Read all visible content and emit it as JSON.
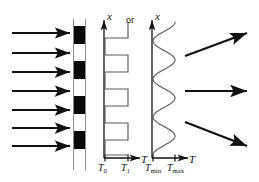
{
  "figure": {
    "background_color": "#ffffff",
    "ink_color": "#111111",
    "curve_color": "#5a5a5a"
  },
  "incident": {
    "label": "incident-rays",
    "count": 7,
    "direction": "right",
    "x_start": 12,
    "x_end": 70,
    "ys": [
      33,
      53,
      72,
      91,
      110,
      128,
      146
    ]
  },
  "grating": {
    "label": "absorbing-grating-mask",
    "x": 73,
    "width": 13,
    "y_top": 19,
    "y_bottom": 170,
    "bar_color": "#0a0a0a",
    "gap_color": "#ffffff",
    "frame_color": "#8a8a8a",
    "bands": [
      {
        "type": "dark",
        "y": 26,
        "height": 18
      },
      {
        "type": "light",
        "y": 44,
        "height": 17
      },
      {
        "type": "dark",
        "y": 61,
        "height": 18
      },
      {
        "type": "light",
        "y": 79,
        "height": 17
      },
      {
        "type": "dark",
        "y": 96,
        "height": 18
      },
      {
        "type": "light",
        "y": 114,
        "height": 17
      },
      {
        "type": "dark",
        "y": 131,
        "height": 18
      }
    ],
    "rails": [
      {
        "x": 73.5,
        "y_top": 19,
        "y_bottom": 170
      },
      {
        "x": 85.5,
        "y_top": 19,
        "y_bottom": 170
      }
    ]
  },
  "plot_square": {
    "label": "square-wave-temperature-profile",
    "y_axis_label": "x",
    "x_axis_label": "T",
    "axis_origin_x": 104,
    "axis_origin_y": 158,
    "axis_top_y": 20,
    "axis_right_x": 140,
    "tick_low_x": 105,
    "tick_high_x": 128,
    "tick_labels": [
      {
        "base": "T",
        "sub": "0",
        "x": 98,
        "y": 163
      },
      {
        "base": "T",
        "sub": "1",
        "x": 121,
        "y": 163
      }
    ],
    "waveform": {
      "type": "square",
      "low_value_x": 105,
      "high_value_x": 128,
      "cycles": 3.5,
      "edges_y": [
        22,
        38,
        55,
        72,
        89,
        106,
        123,
        140,
        155
      ],
      "starts_high": true
    }
  },
  "connector": {
    "label": "or-connector",
    "text": "or",
    "x": 126,
    "y": 15
  },
  "plot_sine": {
    "label": "sinusoidal-temperature-profile",
    "y_axis_label": "x",
    "x_axis_label": "T",
    "axis_origin_x": 152,
    "axis_origin_y": 158,
    "axis_top_y": 20,
    "axis_right_x": 188,
    "tick_min_x": 153,
    "tick_max_x": 175,
    "tick_labels": [
      {
        "base": "T",
        "sub": "min",
        "x": 145,
        "y": 163
      },
      {
        "base": "T",
        "sub": "max",
        "x": 167,
        "y": 163
      }
    ],
    "waveform": {
      "type": "sine",
      "center_x": 164,
      "amplitude_x": 11,
      "cycles": 3.5,
      "y_top": 22,
      "y_bottom": 155
    }
  },
  "emergent": {
    "label": "deflected-rays",
    "count": 3,
    "rays": [
      {
        "name": "ray-up",
        "x1": 185,
        "y1": 56,
        "x2": 247,
        "y2": 33,
        "angle_deg": -20
      },
      {
        "name": "ray-straight",
        "x1": 185,
        "y1": 91,
        "x2": 247,
        "y2": 91,
        "angle_deg": 0
      },
      {
        "name": "ray-down",
        "x1": 185,
        "y1": 122,
        "x2": 247,
        "y2": 146,
        "angle_deg": 21
      }
    ]
  }
}
